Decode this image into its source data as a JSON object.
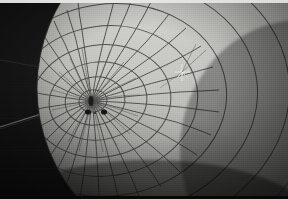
{
  "image": {
    "title": "Gridded spherical balloon envelope, close view",
    "kind": "photograph",
    "width": 288,
    "height": 199,
    "orientation": "landscape"
  },
  "palette": {
    "background_dark": "#0d0d0d",
    "background_dark_2": "#141414",
    "sphere_highlight": "#cfcfcb",
    "sphere_midtone": "#a8a8a4",
    "sphere_shadow": "#6b6b68",
    "sphere_terminator": "#2a2a28",
    "grid_line": "#4a4a47",
    "grid_line_soft": "#636360",
    "edge_strip_light": "#dcdcdc",
    "marker_dark": "#121212",
    "fitting_light": "#e3e3df",
    "guy_line": "#9a9a96"
  },
  "scene": {
    "subject": "large gridded sphere",
    "subject_note": "bright gridded spherical surface filling right two-thirds of frame",
    "background_note": "dark near-black sky at left and lower-left",
    "lighting": "light falls from upper-left; surface darkens toward right and lower edges"
  },
  "geometry": {
    "sphere_center_x": 205,
    "sphere_center_y": 88,
    "sphere_radius": 168,
    "pole_x": 92,
    "pole_y": 101,
    "meridian_count": 48,
    "parallel_ring_count": 9,
    "grid_line_width": 1.0
  },
  "features": [
    {
      "id": "pole-convergence",
      "label": "pole convergence point",
      "x": 92,
      "y": 101
    },
    {
      "id": "marker-blob-main",
      "label": "dark marker at pole",
      "x": 91,
      "y": 101,
      "rx": 2.6,
      "ry": 5.0
    },
    {
      "id": "marker-blob-left",
      "label": "dark marker left of pole",
      "x": 88,
      "y": 112,
      "rx": 3.0,
      "ry": 2.6
    },
    {
      "id": "marker-blob-right",
      "label": "dark marker right of pole",
      "x": 104,
      "y": 112,
      "rx": 3.0,
      "ry": 2.6
    },
    {
      "id": "cross-fitting",
      "label": "bright cross fitting on surface",
      "x": 182,
      "y": 72
    },
    {
      "id": "horizon-line",
      "label": "faint diagonal line across dark background",
      "x1": 0,
      "y1": 126,
      "x2": 74,
      "y2": 104
    },
    {
      "id": "upper-line",
      "label": "faint diagonal line upper left",
      "x1": 0,
      "y1": 60,
      "x2": 46,
      "y2": 68
    }
  ],
  "labels": {
    "frame": "photograph",
    "alt_text": "Close photograph of a large light gray sphere covered with a net of grid lines converging at a pole, set against a dark background"
  }
}
